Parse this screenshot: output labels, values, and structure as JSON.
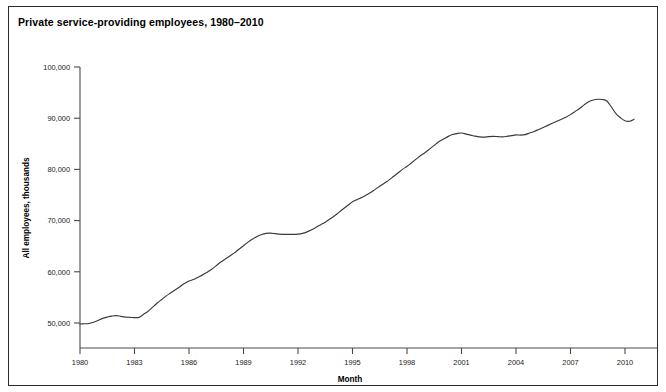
{
  "figure": {
    "title": "Private service-providing employees, 1980–2010"
  },
  "chart_data": {
    "type": "line",
    "title": "Private service-providing employees, 1980–2010",
    "xlabel": "Month",
    "ylabel": "All employees, thousands",
    "xlim": [
      1980,
      2010.6
    ],
    "ylim": [
      44000,
      100000
    ],
    "grid": false,
    "legend": null,
    "x_ticks": [
      1980,
      1983,
      1986,
      1989,
      1992,
      1995,
      1998,
      2001,
      2004,
      2007,
      2010
    ],
    "x_tick_labels": [
      "1980",
      "1983",
      "1986",
      "1989",
      "1992",
      "1995",
      "1998",
      "2001",
      "2004",
      "2007",
      "2010"
    ],
    "y_ticks": [
      50000,
      60000,
      70000,
      80000,
      90000,
      100000
    ],
    "y_tick_labels": [
      "50,000",
      "60,000",
      "70,000",
      "80,000",
      "90,000",
      "100,000"
    ],
    "series": [
      {
        "name": "Private service-providing employees",
        "color": "#3a3a3a",
        "x": [
          1980.0,
          1980.25,
          1980.5,
          1980.75,
          1981.0,
          1981.25,
          1981.5,
          1981.75,
          1982.0,
          1982.25,
          1982.5,
          1982.75,
          1983.0,
          1983.25,
          1983.5,
          1983.75,
          1984.0,
          1984.25,
          1984.5,
          1984.75,
          1985.0,
          1985.25,
          1985.5,
          1985.75,
          1986.0,
          1986.25,
          1986.5,
          1986.75,
          1987.0,
          1987.25,
          1987.5,
          1987.75,
          1988.0,
          1988.25,
          1988.5,
          1988.75,
          1989.0,
          1989.25,
          1989.5,
          1989.75,
          1990.0,
          1990.25,
          1990.5,
          1990.75,
          1991.0,
          1991.25,
          1991.5,
          1991.75,
          1992.0,
          1992.25,
          1992.5,
          1992.75,
          1993.0,
          1993.25,
          1993.5,
          1993.75,
          1994.0,
          1994.25,
          1994.5,
          1994.75,
          1995.0,
          1995.25,
          1995.5,
          1995.75,
          1996.0,
          1996.25,
          1996.5,
          1996.75,
          1997.0,
          1997.25,
          1997.5,
          1997.75,
          1998.0,
          1998.25,
          1998.5,
          1998.75,
          1999.0,
          1999.25,
          1999.5,
          1999.75,
          2000.0,
          2000.25,
          2000.5,
          2000.75,
          2001.0,
          2001.25,
          2001.5,
          2001.75,
          2002.0,
          2002.25,
          2002.5,
          2002.75,
          2003.0,
          2003.25,
          2003.5,
          2003.75,
          2004.0,
          2004.25,
          2004.5,
          2004.75,
          2005.0,
          2005.25,
          2005.5,
          2005.75,
          2006.0,
          2006.25,
          2006.5,
          2006.75,
          2007.0,
          2007.25,
          2007.5,
          2007.75,
          2008.0,
          2008.25,
          2008.5,
          2008.75,
          2009.0,
          2009.25,
          2009.5,
          2009.75,
          2010.0,
          2010.25,
          2010.5
        ],
        "y": [
          49800,
          49850,
          49900,
          50150,
          50500,
          50900,
          51150,
          51350,
          51450,
          51300,
          51150,
          51100,
          51050,
          51100,
          51700,
          52300,
          53100,
          53900,
          54600,
          55300,
          55900,
          56500,
          57100,
          57700,
          58200,
          58500,
          58950,
          59400,
          59900,
          60500,
          61200,
          61900,
          62500,
          63100,
          63700,
          64400,
          65100,
          65800,
          66400,
          66900,
          67300,
          67500,
          67550,
          67450,
          67350,
          67300,
          67300,
          67300,
          67350,
          67500,
          67800,
          68200,
          68700,
          69200,
          69700,
          70300,
          70900,
          71600,
          72300,
          73000,
          73700,
          74100,
          74500,
          75000,
          75500,
          76100,
          76700,
          77300,
          77900,
          78600,
          79300,
          80000,
          80600,
          81300,
          82000,
          82700,
          83300,
          84000,
          84700,
          85400,
          85900,
          86400,
          86800,
          87000,
          87100,
          86900,
          86700,
          86500,
          86350,
          86300,
          86400,
          86450,
          86400,
          86350,
          86450,
          86600,
          86750,
          86700,
          86800,
          87100,
          87400,
          87800,
          88200,
          88600,
          89000,
          89400,
          89800,
          90200,
          90700,
          91300,
          91900,
          92600,
          93200,
          93550,
          93700,
          93650,
          93350,
          92200,
          90900,
          90100,
          89500,
          89400,
          89800
        ]
      }
    ],
    "annotations": [
      {
        "text": "peak",
        "x": 2008.5,
        "y": 93700
      },
      {
        "text": "start",
        "x": 1980.0,
        "y": 49800
      },
      {
        "text": "end",
        "x": 2010.5,
        "y": 89800
      }
    ]
  },
  "axes": {
    "x_axis_title": "Month",
    "y_axis_title": "All employees, thousands"
  }
}
